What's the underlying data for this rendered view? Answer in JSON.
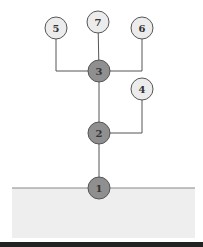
{
  "diagram": {
    "type": "tree",
    "colors": {
      "light_node_fill": "#ececec",
      "dark_node_fill": "#8f8f8f",
      "stroke": "#555555",
      "ground_fill": "#eeeeee",
      "ground_line": "#888888",
      "bottom_bar": "#222222"
    },
    "nodes": [
      {
        "id": "1",
        "label": "1",
        "x": 99,
        "y": 188,
        "style": "dark"
      },
      {
        "id": "2",
        "label": "2",
        "x": 99,
        "y": 133,
        "style": "dark"
      },
      {
        "id": "3",
        "label": "3",
        "x": 99,
        "y": 71,
        "style": "dark"
      },
      {
        "id": "4",
        "label": "4",
        "x": 142,
        "y": 89,
        "style": "light"
      },
      {
        "id": "5",
        "label": "5",
        "x": 56,
        "y": 28,
        "style": "light"
      },
      {
        "id": "6",
        "label": "6",
        "x": 142,
        "y": 28,
        "style": "light"
      },
      {
        "id": "7",
        "label": "7",
        "x": 98,
        "y": 22,
        "style": "light"
      }
    ],
    "edges": [
      {
        "from": "1",
        "to": "2"
      },
      {
        "from": "2",
        "to": "3"
      },
      {
        "from": "2",
        "to": "4"
      },
      {
        "from": "3",
        "to": "5"
      },
      {
        "from": "3",
        "to": "6"
      },
      {
        "from": "3",
        "to": "7"
      }
    ]
  }
}
